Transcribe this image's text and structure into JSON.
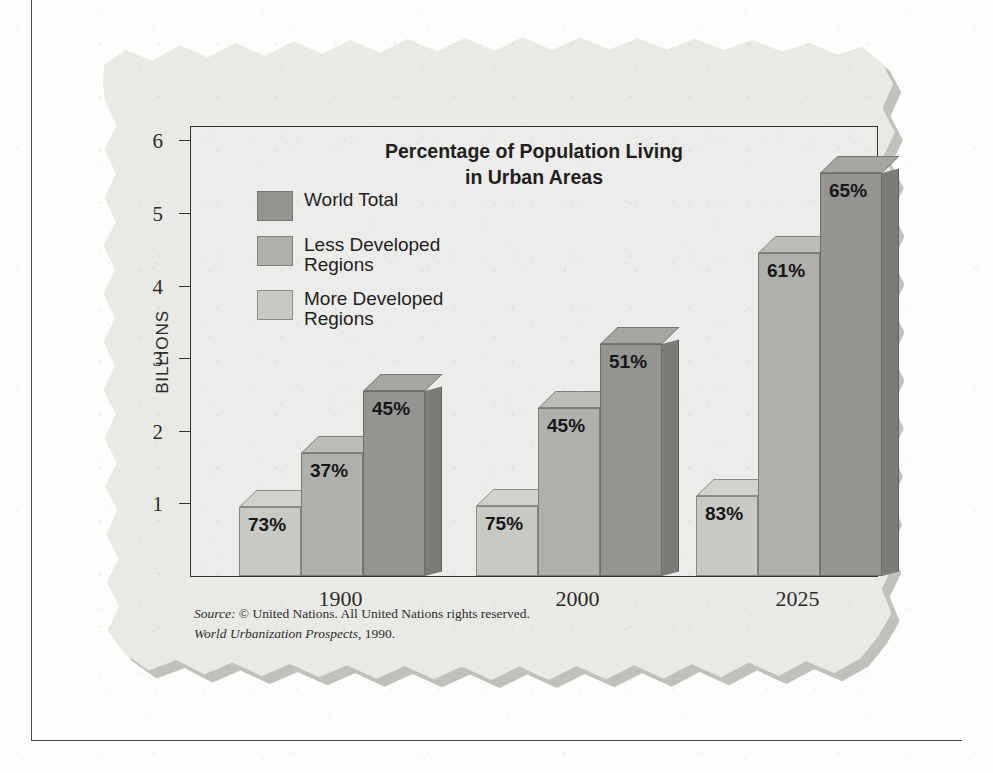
{
  "chart_data": {
    "type": "bar",
    "title": "Percentage of Population Living in Urban Areas",
    "title_line1": "Percentage of Population Living",
    "title_line2": "in Urban Areas",
    "xlabel": "",
    "ylabel": "BILLIONS",
    "categories": [
      "1900",
      "2000",
      "2025"
    ],
    "ylim": [
      0,
      6.5
    ],
    "yticks": [
      1,
      2,
      3,
      4,
      5,
      6
    ],
    "ytick_labels": [
      "1",
      "2",
      "3",
      "4",
      "5",
      "6"
    ],
    "grid": false,
    "legend_position": "upper-left-inside",
    "value_label_suffix": "%",
    "note": "Bar heights are population in billions; printed labels on each bar are the percentage of that population living in urban areas.",
    "series": [
      {
        "name": "More Developed Regions",
        "color": "#c9c9c4",
        "values": [
          0.95,
          0.97,
          1.1
        ],
        "labels": [
          "73%",
          "75%",
          "83%"
        ]
      },
      {
        "name": "Less Developed Regions",
        "color": "#b0b0ab",
        "values": [
          1.7,
          2.32,
          4.45
        ],
        "labels": [
          "37%",
          "45%",
          "61%"
        ]
      },
      {
        "name": "World Total",
        "color": "#949490",
        "values": [
          2.55,
          3.2,
          5.55
        ],
        "labels": [
          "45%",
          "51%",
          "65%"
        ]
      }
    ]
  },
  "legend": {
    "items": [
      {
        "label_line1": "World Total",
        "label_line2": "",
        "color": "#949490"
      },
      {
        "label_line1": "Less Developed",
        "label_line2": "Regions",
        "color": "#b0b0ab"
      },
      {
        "label_line1": "More Developed",
        "label_line2": "Regions",
        "color": "#c9c9c4"
      }
    ]
  },
  "source": {
    "label": "Source:",
    "line1": "© United Nations. All United Nations rights reserved.",
    "line2_italic": "World Urbanization Prospects",
    "line2_rest": ", 1990."
  },
  "colors": {
    "page_background": "#fdfdfb",
    "card_background": "#e9e9e5",
    "plot_background": "#ececea",
    "frame_line": "#33332f",
    "text": "#1f1f1c"
  }
}
